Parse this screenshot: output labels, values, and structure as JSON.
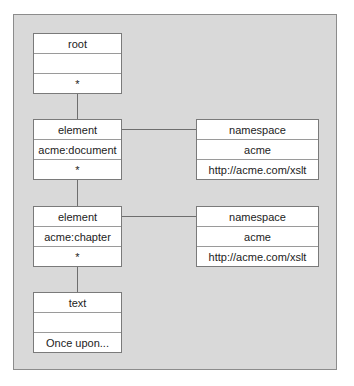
{
  "diagram": {
    "nodes": [
      {
        "id": "root",
        "rows": [
          "root",
          "",
          "*"
        ]
      },
      {
        "id": "element-document",
        "rows": [
          "element",
          "acme:document",
          "*"
        ]
      },
      {
        "id": "namespace-1",
        "rows": [
          "namespace",
          "acme",
          "http://acme.com/xslt"
        ]
      },
      {
        "id": "element-chapter",
        "rows": [
          "element",
          "acme:chapter",
          "*"
        ]
      },
      {
        "id": "namespace-2",
        "rows": [
          "namespace",
          "acme",
          "http://acme.com/xslt"
        ]
      },
      {
        "id": "text",
        "rows": [
          "text",
          "",
          "Once upon..."
        ]
      }
    ],
    "edges": [
      {
        "from": "root",
        "to": "element-document"
      },
      {
        "from": "element-document",
        "to": "namespace-1"
      },
      {
        "from": "element-document",
        "to": "element-chapter"
      },
      {
        "from": "element-chapter",
        "to": "namespace-2"
      },
      {
        "from": "element-chapter",
        "to": "text"
      }
    ]
  }
}
